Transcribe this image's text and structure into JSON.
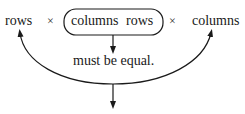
{
  "diagram": {
    "left_operand": "rows",
    "times_symbol_1": "×",
    "inner_left": "columns",
    "inner_right": "rows",
    "times_symbol_2": "×",
    "right_operand": "columns",
    "note": "must be equal."
  },
  "colors": {
    "ink": "#1a1a1a",
    "background": "#ffffff"
  }
}
